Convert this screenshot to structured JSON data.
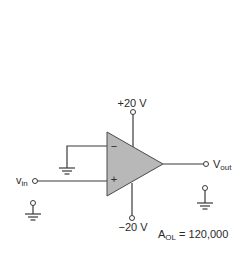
{
  "diagram": {
    "type": "op-amp comparator circuit",
    "supply_positive": {
      "label": "+20 V"
    },
    "supply_negative": {
      "label": "−20 V"
    },
    "input": {
      "label": "v",
      "subscript": "in"
    },
    "output": {
      "label": "V",
      "subscript": "out"
    },
    "inverting_pin": {
      "symbol": "−"
    },
    "noninverting_pin": {
      "symbol": "+"
    },
    "gain": {
      "label": "A",
      "subscript": "OL",
      "equals": " = ",
      "value": "120,000"
    },
    "colors": {
      "opamp_fill": "#b8b8b8",
      "wire": "#3a3a3a",
      "text": "#2a2a2a"
    }
  }
}
